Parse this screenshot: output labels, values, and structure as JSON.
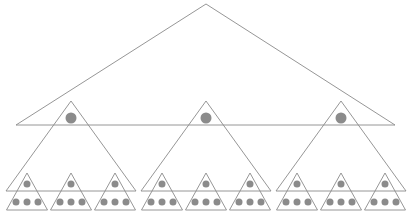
{
  "diagram": {
    "type": "fractal-triangle-hierarchy",
    "colors": {
      "stroke": "#8a8a8a",
      "dot": "#8b8b8b",
      "background": "#ffffff"
    },
    "levels": [
      {
        "level": 0,
        "triangles": [
          {
            "apex": [
              206,
              4
            ],
            "base_left": [
              16,
              125
            ],
            "base_right": [
              395,
              125
            ]
          }
        ]
      },
      {
        "level": 1,
        "triangles": [
          {
            "apex": [
              71,
              101
            ],
            "base_left": [
              6,
              191
            ],
            "base_right": [
              136,
              191
            ],
            "dot": {
              "cx": 71,
              "cy": 118,
              "r": 5.5
            }
          },
          {
            "apex": [
              206,
              101
            ],
            "base_left": [
              141,
              191
            ],
            "base_right": [
              271,
              191
            ],
            "dot": {
              "cx": 206,
              "cy": 118,
              "r": 5.5
            }
          },
          {
            "apex": [
              341,
              101
            ],
            "base_left": [
              276,
              191
            ],
            "base_right": [
              406,
              191
            ],
            "dot": {
              "cx": 341,
              "cy": 118,
              "r": 5.5
            }
          }
        ]
      },
      {
        "level": 2,
        "small_triangle": {
          "half_width": 20.5,
          "apex_y": 173,
          "base_y": 210,
          "top_dot": {
            "dy": 11,
            "r": 3.5
          },
          "bottom_dots": {
            "y": 202,
            "offsets": [
              -11,
              0,
              11
            ],
            "r": 3.5
          }
        },
        "centers": [
          27,
          71,
          115,
          162,
          206,
          250,
          297,
          341,
          385
        ]
      }
    ]
  },
  "watermark": {
    "text": ""
  }
}
